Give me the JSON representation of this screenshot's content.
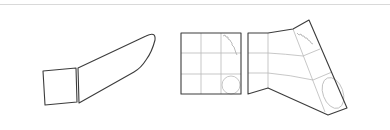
{
  "diagram": {
    "colors": {
      "outline": "#3c3c3c",
      "grid": "#b9b9b9",
      "border": "#d9d9d9",
      "background": "#ffffff"
    },
    "panels": [
      {
        "id": "left-pair",
        "shapes": [
          "square",
          "elongated-rounded-quad"
        ]
      },
      {
        "id": "right-pair",
        "shapes": [
          "grid-square-3x3-with-circle",
          "warped-grid-with-ellipse"
        ]
      }
    ]
  }
}
